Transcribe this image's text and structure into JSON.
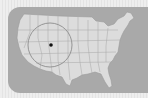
{
  "map": {
    "title": "",
    "region": "Contiguous United States",
    "colors": {
      "frame": "#ececec",
      "water_panel": "#a9a9a9",
      "land": "#dcdcdc",
      "borders": "#9a9a9a",
      "highlight_circle": "#8c8c8c",
      "marker": "#111111"
    },
    "highlight": {
      "shape": "circle",
      "center_px": [
        50,
        45
      ],
      "radius_px": 22
    },
    "marker": {
      "shape": "dot",
      "position_px": [
        51,
        45
      ]
    }
  }
}
